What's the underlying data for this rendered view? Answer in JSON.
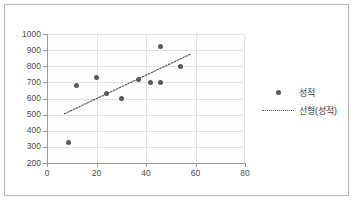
{
  "chart_data": {
    "type": "scatter",
    "title": "",
    "xlabel": "",
    "ylabel": "",
    "xlim": [
      0,
      80
    ],
    "ylim": [
      200,
      1000
    ],
    "xticks": [
      0,
      20,
      40,
      60,
      80
    ],
    "yticks": [
      200,
      300,
      400,
      500,
      600,
      700,
      800,
      900,
      1000
    ],
    "grid": true,
    "legend_position": "right",
    "series": [
      {
        "name": "성적",
        "type": "scatter",
        "marker": "circle",
        "color": "#59595F",
        "points": [
          {
            "x": 8.5,
            "y": 325
          },
          {
            "x": 12,
            "y": 680
          },
          {
            "x": 20,
            "y": 730
          },
          {
            "x": 24,
            "y": 630
          },
          {
            "x": 30,
            "y": 600
          },
          {
            "x": 37,
            "y": 720
          },
          {
            "x": 42,
            "y": 700
          },
          {
            "x": 46,
            "y": 700
          },
          {
            "x": 46,
            "y": 920
          },
          {
            "x": 54,
            "y": 800
          }
        ]
      },
      {
        "name": "선형(성적)",
        "type": "line",
        "style": "dotted",
        "color": "#5A5A5A",
        "points": [
          {
            "x": 7,
            "y": 505
          },
          {
            "x": 58,
            "y": 875
          }
        ]
      }
    ]
  },
  "legend": {
    "items": [
      {
        "label": "성적",
        "key": "marker-dot"
      },
      {
        "label": "선형(성적)",
        "key": "dotted-line"
      }
    ]
  }
}
